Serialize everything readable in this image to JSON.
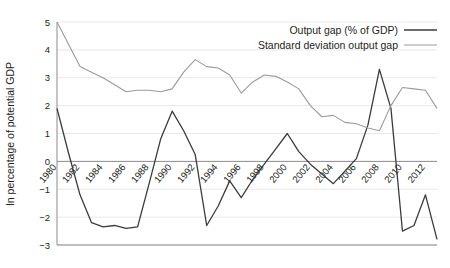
{
  "chart_data": {
    "type": "line",
    "title": "",
    "xlabel": "",
    "ylabel": "In percentage of potential GDP",
    "ylim": [
      -3,
      5
    ],
    "xlim": [
      1980,
      2013
    ],
    "grid": true,
    "legend_position": "top-right",
    "ytick_labels": [
      "5",
      "4",
      "3",
      "2",
      "1",
      "0",
      "-1",
      "-2",
      "-3"
    ],
    "ytick_values": [
      5,
      4,
      3,
      2,
      1,
      0,
      -1,
      -2,
      -3
    ],
    "xtick_labels": [
      "1980",
      "1982",
      "1984",
      "1986",
      "1988",
      "1990",
      "1992",
      "1994",
      "1996",
      "1998",
      "2000",
      "2002",
      "2004",
      "2006",
      "2008",
      "2010",
      "2012"
    ],
    "xtick_values": [
      1980,
      1982,
      1984,
      1986,
      1988,
      1990,
      1992,
      1994,
      1996,
      1998,
      2000,
      2002,
      2004,
      2006,
      2008,
      2010,
      2012
    ],
    "x": [
      1980,
      1981,
      1982,
      1983,
      1984,
      1985,
      1986,
      1987,
      1988,
      1989,
      1990,
      1991,
      1992,
      1993,
      1994,
      1995,
      1996,
      1997,
      1998,
      1999,
      2000,
      2001,
      2002,
      2003,
      2004,
      2005,
      2006,
      2007,
      2008,
      2009,
      2010,
      2011,
      2012,
      2013
    ],
    "series": [
      {
        "name": "Output gap (% of GDP)",
        "color": "#3b3b3b",
        "width": 1.3,
        "values": [
          1.9,
          0.3,
          -1.2,
          -2.2,
          -2.35,
          -2.3,
          -2.4,
          -2.35,
          -0.8,
          0.8,
          1.8,
          1.1,
          0.25,
          -2.3,
          -1.6,
          -0.7,
          -1.3,
          -0.65,
          -0.1,
          0.45,
          1.0,
          0.35,
          -0.1,
          -0.45,
          -0.8,
          -0.35,
          0.1,
          1.3,
          3.3,
          1.9,
          -2.5,
          -2.3,
          -1.2,
          -2.8
        ]
      },
      {
        "name": "Standard deviation output gap",
        "color": "#9b9b9b",
        "width": 1.1,
        "values": [
          5.0,
          4.2,
          3.4,
          3.2,
          3.0,
          2.75,
          2.5,
          2.55,
          2.55,
          2.5,
          2.6,
          3.2,
          3.65,
          3.4,
          3.35,
          3.1,
          2.45,
          2.85,
          3.1,
          3.05,
          2.85,
          2.6,
          2.0,
          1.6,
          1.65,
          1.4,
          1.35,
          1.2,
          1.1,
          2.0,
          2.65,
          2.6,
          2.55,
          1.9
        ]
      }
    ]
  },
  "legend": {
    "items": [
      {
        "label": "Output gap (% of GDP)",
        "color": "#3b3b3b",
        "width": 1.6
      },
      {
        "label": "Standard deviation output gap",
        "color": "#9b9b9b",
        "width": 1.2
      }
    ]
  },
  "axis": {
    "y_title": "In percentage of potential GDP"
  }
}
